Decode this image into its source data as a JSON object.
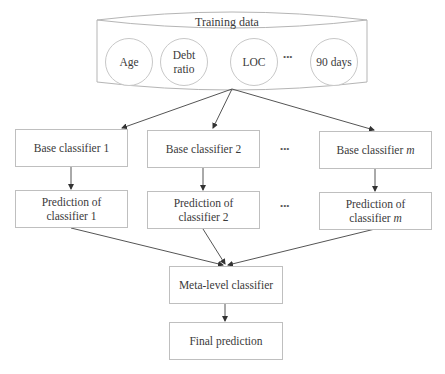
{
  "diagram": {
    "title": "Training data",
    "features": [
      {
        "line1": "Age",
        "line2": ""
      },
      {
        "line1": "Debt",
        "line2": "ratio"
      },
      {
        "line1": "LOC",
        "line2": ""
      },
      {
        "line1": "90 days",
        "line2": ""
      }
    ],
    "feature_ellipsis": "•••",
    "base_classifiers": [
      {
        "prefix": "Base classifier ",
        "suffix": "1",
        "suffix_italic": false
      },
      {
        "prefix": "Base classifier ",
        "suffix": "2",
        "suffix_italic": false
      },
      {
        "prefix": "Base classifier ",
        "suffix": "m",
        "suffix_italic": true
      }
    ],
    "predictions": [
      {
        "line1": "Prediction of",
        "line2_prefix": "classifier ",
        "line2_suffix": "1",
        "suffix_italic": false
      },
      {
        "line1": "Prediction of",
        "line2_prefix": "classifier ",
        "line2_suffix": "2",
        "suffix_italic": false
      },
      {
        "line1": "Prediction of",
        "line2_prefix": "classifier ",
        "line2_suffix": "m",
        "suffix_italic": true
      }
    ],
    "column_ellipsis": "•••",
    "meta_classifier": "Meta-level classifier",
    "final_prediction": "Final prediction",
    "colors": {
      "line": "#555555",
      "border": "#bfbfbf",
      "text": "#3a3a3a"
    }
  }
}
